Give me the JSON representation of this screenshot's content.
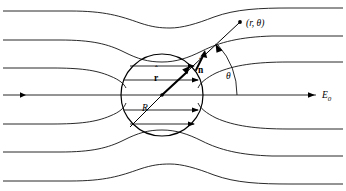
{
  "figure": {
    "type": "physics-field-diagram",
    "background_color": "#ffffff",
    "line_color": "#111111",
    "width": 346,
    "height": 191
  },
  "labels": {
    "point": "(r, θ)",
    "point_marker": "dot-marker",
    "r_hat": "r",
    "r_hat_accent": "ˆ",
    "n_hat": "n",
    "n_hat_accent": "ˆ",
    "radius": "R",
    "theta": "θ",
    "field": "E",
    "field_sub": "0"
  },
  "sphere": {
    "center_x": 162,
    "center_y": 95,
    "radius": 41,
    "stroke": "#000000"
  },
  "axis": {
    "y": 95,
    "x_start": 3,
    "x_end": 316,
    "left_arrow_x": 22,
    "right_arrow_x": 312
  },
  "field_lines_left_y": [
    11,
    40,
    68,
    95,
    124,
    152,
    181
  ],
  "field_lines_right_y": [
    11,
    40,
    68,
    95,
    124,
    152,
    181
  ],
  "inner_lines_y": [
    66,
    80,
    95,
    110,
    124
  ],
  "vectors": {
    "radial_angle_deg": 42,
    "point_x": 240,
    "point_y": 22,
    "n_arrow_label_x": 202,
    "n_arrow_label_y": 70
  },
  "theta_arc": {
    "center_x": 162,
    "center_y": 95,
    "radius": 75,
    "start_deg": 0,
    "end_deg": 42,
    "label_x": 228,
    "label_y": 76
  }
}
